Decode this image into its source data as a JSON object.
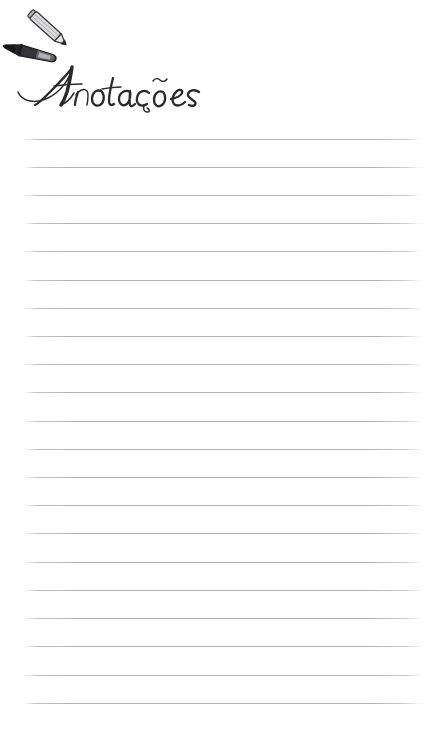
{
  "page": {
    "background_color": "#ffffff",
    "width": 444,
    "height": 729,
    "document_type": "lined-notes-page"
  },
  "header": {
    "title": "Anotações",
    "title_language": "pt-BR",
    "title_style": "handwritten-script",
    "title_color": "#2a2a2c",
    "icons": [
      {
        "name": "pencil-icon",
        "description": "gray wooden pencil angled down-right",
        "body_color": "#d8d8da",
        "outline_color": "#3a3a3c",
        "tip_color": "#2b2b2d"
      },
      {
        "name": "pen-icon",
        "description": "dark marker pen angled slightly down-right",
        "body_color": "#2e2e30",
        "outline_color": "#1d1d1f",
        "tip_color": "#1a1a1c"
      }
    ]
  },
  "notes_area": {
    "label": "ruled writing lines",
    "line_color": "#b0b0b6",
    "line_count": 21,
    "line_left": 25,
    "line_right": 420,
    "line_start_y": 139,
    "line_spacing": 28,
    "lines": [
      {
        "index": 1,
        "y": 139,
        "text": ""
      },
      {
        "index": 2,
        "y": 167,
        "text": ""
      },
      {
        "index": 3,
        "y": 195,
        "text": ""
      },
      {
        "index": 4,
        "y": 223,
        "text": ""
      },
      {
        "index": 5,
        "y": 251,
        "text": ""
      },
      {
        "index": 6,
        "y": 280,
        "text": ""
      },
      {
        "index": 7,
        "y": 308,
        "text": ""
      },
      {
        "index": 8,
        "y": 336,
        "text": ""
      },
      {
        "index": 9,
        "y": 364,
        "text": ""
      },
      {
        "index": 10,
        "y": 392,
        "text": ""
      },
      {
        "index": 11,
        "y": 421,
        "text": ""
      },
      {
        "index": 12,
        "y": 449,
        "text": ""
      },
      {
        "index": 13,
        "y": 477,
        "text": ""
      },
      {
        "index": 14,
        "y": 505,
        "text": ""
      },
      {
        "index": 15,
        "y": 533,
        "text": ""
      },
      {
        "index": 16,
        "y": 562,
        "text": ""
      },
      {
        "index": 17,
        "y": 590,
        "text": ""
      },
      {
        "index": 18,
        "y": 618,
        "text": ""
      },
      {
        "index": 19,
        "y": 646,
        "text": ""
      },
      {
        "index": 20,
        "y": 675,
        "text": ""
      },
      {
        "index": 21,
        "y": 703,
        "text": ""
      }
    ]
  }
}
